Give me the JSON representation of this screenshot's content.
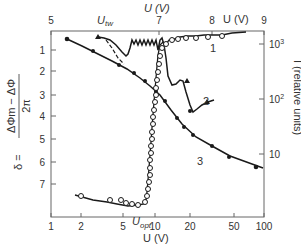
{
  "chart_data": {
    "type": "line",
    "title": "",
    "axes": {
      "bottom": {
        "label": "U (V)",
        "scale": "log",
        "range": [
          1,
          100
        ],
        "ticks": [
          "1",
          "2",
          "5",
          "10",
          "20",
          "50",
          "100"
        ],
        "annotation": "U_opt"
      },
      "top": {
        "label": "U (V)",
        "scale": "linear",
        "range": [
          5,
          9
        ],
        "ticks": [
          "5",
          "7",
          "8",
          "9"
        ],
        "annotation": "U_tw"
      },
      "left": {
        "label": "δ = (ΔΦm − ΔΦ) / 2π",
        "scale": "linear",
        "range": [
          0.1,
          8
        ],
        "inverted": true,
        "ticks": [
          "1",
          "2",
          "3",
          "4",
          "5",
          "6",
          "7"
        ]
      },
      "right": {
        "label": "I (relative units)",
        "scale": "log",
        "ticks": [
          "10³",
          "10²",
          "10"
        ]
      }
    },
    "series": [
      {
        "name": "1",
        "axis": "top x / right I",
        "marker": "open-circle",
        "description": "Intensity vs U (top axis 5–9 V): starts near U_tw, strong oscillations between ~6.2 and ~7 V, then rises to ~10³ near 8.5 V",
        "x": [
          6.9,
          7.1,
          7.3,
          7.5,
          7.7,
          7.9,
          8.1,
          8.3,
          8.5
        ],
        "values_I": [
          300,
          500,
          700,
          800,
          850,
          900,
          950,
          1000,
          1100
        ]
      },
      {
        "name": "2",
        "axis": "top x / right I",
        "marker": "filled-triangle",
        "description": "Intensity vs U (top axis): peak near U_tw, oscillating region, then decline to ~60 with minimum ~40",
        "x": [
          5.9,
          6.1,
          6.3,
          7.0,
          7.3,
          7.5,
          7.9,
          8.3
        ],
        "values_I": [
          1000,
          700,
          300,
          900,
          150,
          120,
          40,
          60
        ]
      },
      {
        "name": "3",
        "axis": "bottom x / left δ",
        "marker": "filled-circle",
        "description": "δ vs U (log bottom axis) decreasing monotonically",
        "x": [
          1.6,
          2.7,
          4.0,
          5.0,
          6.5,
          8.0,
          10.0,
          13.0,
          17.0,
          22.0,
          30.0,
          45.0,
          90.0
        ],
        "values": [
          0.6,
          1.3,
          2.0,
          2.5,
          3.0,
          3.5,
          4.1,
          4.6,
          5.0,
          5.4,
          5.8,
          6.2,
          6.6
        ]
      },
      {
        "name": "I (open circles, bottom axis)",
        "axis": "bottom x / right I",
        "marker": "open-circle",
        "description": "Intensity near zero at low U, sharp rise at U_opt ≈ 8–9 V",
        "x": [
          2.0,
          3.5,
          4.5,
          5.5,
          6.5,
          7.5,
          8.0,
          8.3,
          8.6,
          8.8,
          9.0,
          9.3,
          9.6,
          10.0
        ],
        "values_I": [
          3,
          2.5,
          2.3,
          2.2,
          2.1,
          2.1,
          2.2,
          3,
          5,
          10,
          40,
          150,
          500,
          900
        ]
      }
    ],
    "annotations": [
      {
        "text": "U_tw",
        "position": "top axis near 6 V"
      },
      {
        "text": "U_opt",
        "position": "bottom axis near 8–9 V"
      },
      {
        "text": "1",
        "position": "near upper-right curve"
      },
      {
        "text": "2",
        "position": "middle right"
      },
      {
        "text": "3",
        "position": "lower middle"
      }
    ],
    "grid": false,
    "legend": "none (inline curve labels 1, 2, 3)"
  },
  "labels": {
    "bottom_axis": "U (V)",
    "top_axis_center": "U (V)",
    "top_axis_right": "U (V)",
    "u_tw": "U",
    "u_tw_sub": "tw",
    "u_opt": "U",
    "u_opt_sub": "opt",
    "left_axis_delta": "δ =",
    "left_axis_num": "ΔΦm − ΔΦ",
    "left_axis_den": "2π",
    "right_axis": "I (relative units)",
    "curve1": "1",
    "curve2": "2",
    "curve3": "3"
  },
  "ticks": {
    "bottom": [
      {
        "label": "1",
        "x": 51
      },
      {
        "label": "2",
        "x": 81
      },
      {
        "label": "5",
        "x": 123
      },
      {
        "label": "10",
        "x": 155
      },
      {
        "label": "20",
        "x": 190
      },
      {
        "label": "50",
        "x": 234
      },
      {
        "label": "100",
        "x": 264
      }
    ],
    "top": [
      {
        "label": "5",
        "x": 51
      },
      {
        "label": "7",
        "x": 159
      },
      {
        "label": "8",
        "x": 212
      },
      {
        "label": "9",
        "x": 264
      }
    ],
    "left": [
      {
        "label": "1",
        "y": 50
      },
      {
        "label": "2",
        "y": 71
      },
      {
        "label": "3",
        "y": 95
      },
      {
        "label": "4",
        "y": 116
      },
      {
        "label": "5",
        "y": 139
      },
      {
        "label": "6",
        "y": 162
      },
      {
        "label": "7",
        "y": 184
      }
    ],
    "right": [
      {
        "label": "10",
        "sup": "3",
        "y": 44
      },
      {
        "label": "10",
        "sup": "2",
        "y": 99
      },
      {
        "label": "10",
        "sup": "",
        "y": 154
      }
    ]
  },
  "colors": {
    "line": "#1a1a1a",
    "frame": "#666666",
    "text": "#333333"
  }
}
